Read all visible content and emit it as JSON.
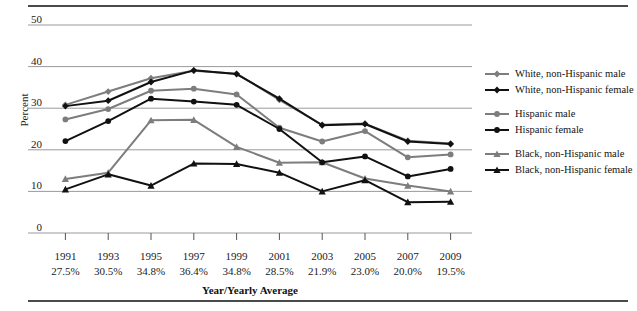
{
  "chart_data": {
    "type": "line",
    "title": "",
    "xlabel": "Year/Yearly Average",
    "ylabel": "Percent",
    "categories": [
      "1991",
      "1993",
      "1995",
      "1997",
      "1999",
      "2001",
      "2003",
      "2005",
      "2007",
      "2009"
    ],
    "category_sublabels": [
      "27.5%",
      "30.5%",
      "34.8%",
      "36.4%",
      "34.8%",
      "28.5%",
      "21.9%",
      "23.0%",
      "20.0%",
      "19.5%"
    ],
    "ylim": [
      0,
      50
    ],
    "yticks": [
      0,
      10,
      20,
      30,
      40,
      50
    ],
    "grid": true,
    "legend_position": "right",
    "series": [
      {
        "name": "White, non-Hispanic male",
        "color": "#7d7d7d",
        "marker": "diamond",
        "values": [
          30.8,
          34.0,
          37.2,
          39.0,
          38.3,
          32.0,
          26.0,
          26.3,
          22.2,
          21.5
        ]
      },
      {
        "name": "White, non-Hispanic female",
        "color": "#111111",
        "marker": "diamond",
        "values": [
          30.5,
          31.8,
          36.3,
          39.1,
          38.2,
          32.3,
          25.9,
          26.2,
          22.0,
          21.4
        ]
      },
      {
        "name": "Hispanic male",
        "color": "#7d7d7d",
        "marker": "circle",
        "values": [
          27.3,
          29.8,
          34.2,
          34.7,
          33.3,
          25.3,
          22.0,
          24.5,
          18.2,
          18.9
        ]
      },
      {
        "name": "Hispanic female",
        "color": "#111111",
        "marker": "circle",
        "values": [
          22.1,
          26.9,
          32.3,
          31.6,
          30.8,
          25.0,
          17.0,
          18.4,
          13.6,
          15.4
        ]
      },
      {
        "name": "Black, non-Hispanic male",
        "color": "#7d7d7d",
        "marker": "triangle",
        "values": [
          13.0,
          14.5,
          27.1,
          27.2,
          20.7,
          16.9,
          17.0,
          13.1,
          11.4,
          10.0
        ]
      },
      {
        "name": "Black, non-Hispanic female",
        "color": "#111111",
        "marker": "triangle",
        "values": [
          10.5,
          14.1,
          11.4,
          16.7,
          16.6,
          14.5,
          10.0,
          12.7,
          7.4,
          7.5
        ]
      }
    ]
  },
  "axis": {
    "y_title": "Percent",
    "x_title": "Year/Yearly Average",
    "ytick_labels": [
      "50",
      "40",
      "30",
      "20",
      "10",
      "0"
    ]
  },
  "legend": {
    "groups": [
      {
        "rows": [
          {
            "label": "White, non-Hispanic male",
            "color": "#7d7d7d",
            "marker": "diamond"
          },
          {
            "label": "White, non-Hispanic female",
            "color": "#111111",
            "marker": "diamond"
          }
        ]
      },
      {
        "rows": [
          {
            "label": "Hispanic male",
            "color": "#7d7d7d",
            "marker": "circle"
          },
          {
            "label": "Hispanic female",
            "color": "#111111",
            "marker": "circle"
          }
        ]
      },
      {
        "rows": [
          {
            "label": "Black, non-Hispanic male",
            "color": "#7d7d7d",
            "marker": "triangle"
          },
          {
            "label": "Black, non-Hispanic female",
            "color": "#111111",
            "marker": "triangle"
          }
        ]
      }
    ]
  }
}
